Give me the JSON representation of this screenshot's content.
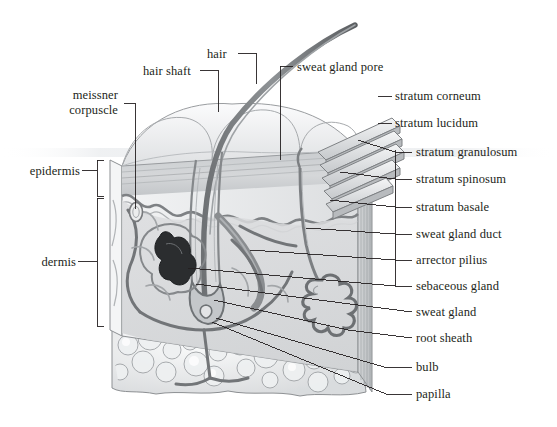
{
  "figure": {
    "kind": "anatomical-cross-section",
    "background_color": "#ffffff",
    "line_color": "#231f20",
    "palette": {
      "outline": "#4a4a4a",
      "epidermis_fill": "#cfd2d4",
      "dermis_fill": "#d9dadb",
      "surface_fill": "#f0f1f2",
      "fat_fill": "#e6e7e8",
      "vessel_dark": "#6f7376",
      "hair_dark": "#57595b",
      "gland_gray": "#8a8d8f",
      "label_text": "#231f20"
    }
  },
  "labels": {
    "left": [
      {
        "id": "meissner-corpuscle",
        "lines": [
          "meissner",
          "corpuscle"
        ],
        "x": 59,
        "y": 88
      },
      {
        "id": "epidermis",
        "lines": [
          "epidermis"
        ],
        "x": 28,
        "y": 166
      },
      {
        "id": "dermis",
        "lines": [
          "dermis"
        ],
        "x": 28,
        "y": 257
      }
    ],
    "top": [
      {
        "id": "hair-shaft",
        "lines": [
          "hair shaft"
        ],
        "x": 143,
        "y": 66
      },
      {
        "id": "hair",
        "lines": [
          "hair"
        ],
        "x": 207,
        "y": 49
      },
      {
        "id": "sweat-gland-pore",
        "lines": [
          "sweat gland pore"
        ],
        "x": 297,
        "y": 62
      }
    ],
    "right": [
      {
        "id": "stratum-corneum",
        "lines": [
          "stratum corneum"
        ],
        "x": 395,
        "y": 92
      },
      {
        "id": "stratum-lucidum",
        "lines": [
          "stratum lucidum"
        ],
        "x": 395,
        "y": 119
      },
      {
        "id": "stratum-granulosum",
        "lines": [
          "stratum granulosum"
        ],
        "x": 415,
        "y": 148
      },
      {
        "id": "stratum-spinosum",
        "lines": [
          "stratum spinosum"
        ],
        "x": 415,
        "y": 175
      },
      {
        "id": "stratum-basale",
        "lines": [
          "stratum basale"
        ],
        "x": 415,
        "y": 203
      },
      {
        "id": "sweat-gland-duct",
        "lines": [
          "sweat gland duct"
        ],
        "x": 415,
        "y": 230
      },
      {
        "id": "arrector-pilius",
        "lines": [
          "arrector pilius"
        ],
        "x": 415,
        "y": 256
      },
      {
        "id": "sebaceous-gland",
        "lines": [
          "sebaceous gland"
        ],
        "x": 415,
        "y": 282
      },
      {
        "id": "sweat-gland",
        "lines": [
          "sweat gland"
        ],
        "x": 415,
        "y": 308
      },
      {
        "id": "root-sheath",
        "lines": [
          "root sheath"
        ],
        "x": 415,
        "y": 334
      },
      {
        "id": "bulb",
        "lines": [
          "bulb"
        ],
        "x": 415,
        "y": 363
      },
      {
        "id": "papilla",
        "lines": [
          "papilla"
        ],
        "x": 415,
        "y": 390
      }
    ]
  }
}
